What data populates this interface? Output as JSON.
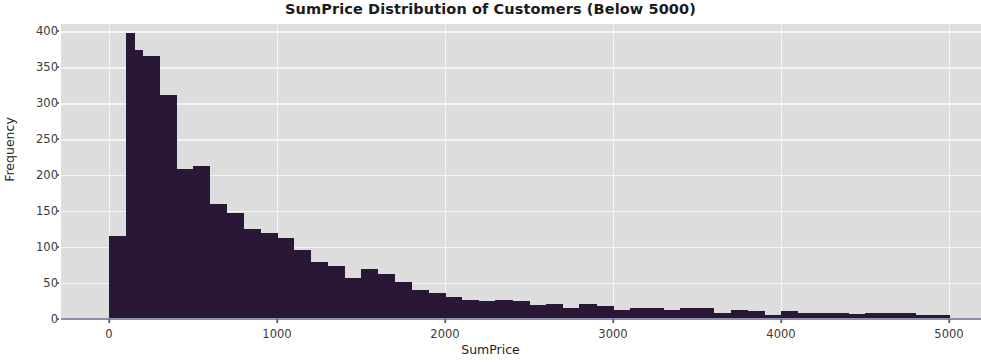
{
  "chart_data": {
    "type": "bar",
    "subtype": "histogram",
    "title": "SumPrice Distribution of Customers (Below 5000)",
    "xlabel": "SumPrice",
    "ylabel": "Frequency",
    "xlim": [
      0,
      5000
    ],
    "ylim": [
      0,
      410
    ],
    "xticks": [
      0,
      1000,
      2000,
      3000,
      4000,
      5000
    ],
    "yticks": [
      0,
      50,
      100,
      150,
      200,
      250,
      300,
      350,
      400
    ],
    "grid": true,
    "legend": null,
    "bar_color": "#2a1635",
    "plot_background": "#dddddd",
    "grid_color": "#f4f4f4",
    "bin_width": 50,
    "bin_starts": [
      0,
      50,
      100,
      150,
      200,
      250,
      300,
      350,
      400,
      450,
      500,
      550,
      600,
      650,
      700,
      750,
      800,
      850,
      900,
      950,
      1000,
      1050,
      1100,
      1150,
      1200,
      1250,
      1300,
      1350,
      1400,
      1450,
      1500,
      1550,
      1600,
      1650,
      1700,
      1750,
      1800,
      1850,
      1900,
      1950,
      2000,
      2050,
      2100,
      2150,
      2200,
      2250,
      2300,
      2350,
      2400,
      2450,
      2500,
      2550,
      2600,
      2650,
      2700,
      2750,
      2800,
      2850,
      2900,
      2950,
      3000,
      3050,
      3100,
      3150,
      3200,
      3250,
      3300,
      3350,
      3400,
      3450,
      3500,
      3550,
      3600,
      3650,
      3700,
      3750,
      3800,
      3850,
      3900,
      3950,
      4000,
      4050,
      4100,
      4150,
      4200,
      4250,
      4300,
      4350,
      4400,
      4450,
      4500,
      4550,
      4600,
      4650,
      4700,
      4750,
      4800,
      4850,
      4900,
      4950
    ],
    "values": [
      115,
      115,
      398,
      374,
      365,
      365,
      311,
      311,
      208,
      208,
      212,
      212,
      160,
      160,
      148,
      148,
      125,
      125,
      120,
      120,
      112,
      112,
      96,
      96,
      79,
      79,
      74,
      74,
      57,
      57,
      70,
      70,
      62,
      62,
      52,
      52,
      40,
      40,
      36,
      36,
      30,
      30,
      27,
      27,
      25,
      25,
      26,
      26,
      25,
      25,
      19,
      19,
      21,
      21,
      16,
      16,
      21,
      21,
      18,
      18,
      13,
      13,
      15,
      15,
      15,
      15,
      12,
      12,
      16,
      16,
      16,
      16,
      9,
      9,
      12,
      12,
      11,
      11,
      6,
      6,
      11,
      11,
      9,
      9,
      8,
      8,
      9,
      9,
      7,
      7,
      9,
      9,
      8,
      8,
      9,
      9,
      6,
      6,
      5,
      5
    ]
  }
}
